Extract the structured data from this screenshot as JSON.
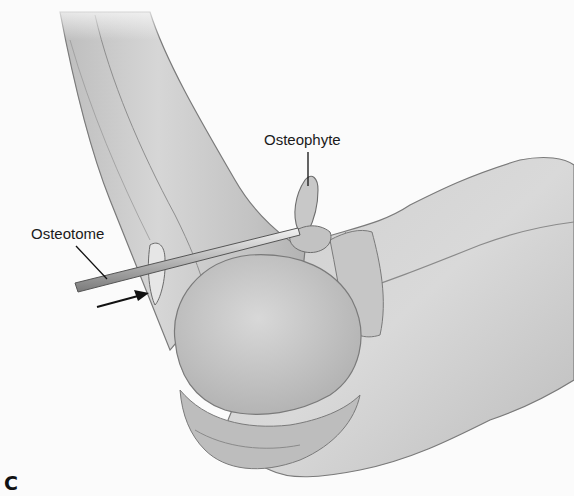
{
  "figure": {
    "panel_label": "C",
    "labels": {
      "osteophyte": "Osteophyte",
      "osteotome": "Osteotome"
    },
    "colors": {
      "background": "#fbfbfb",
      "bone_fill": "#c9c9c9",
      "bone_light": "#dcdcdc",
      "bone_shadow": "#a8a8a8",
      "outline": "#6e6e6e",
      "leader_line": "#111111"
    }
  }
}
